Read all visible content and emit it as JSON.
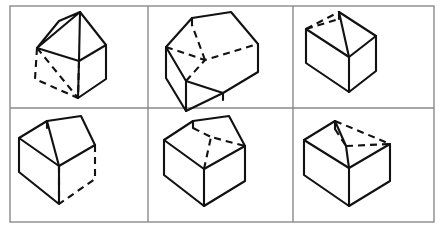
{
  "figure": {
    "width": 441,
    "height": 231,
    "columns": 3,
    "rows": 2,
    "background_color": "#ffffff",
    "line_color": "#111111",
    "frame_color": "#8a8a8a"
  },
  "grid": {
    "outer_frame": {
      "x": 10,
      "y": 6,
      "width": 424,
      "height": 216
    },
    "vertical_dividers": [
      148,
      293
    ],
    "horizontal_dividers": [
      108
    ]
  },
  "panels": [
    {
      "id": "panel-1",
      "position": "top-left",
      "row": 1,
      "column": 1,
      "label": "Box with hidden left and bottom-front edges dashed",
      "hidden_edge_count": 5,
      "solid_edges": [
        [
          38,
          47,
          58,
          22
        ],
        [
          58,
          22,
          78,
          12
        ],
        [
          78,
          12,
          38,
          47
        ],
        [
          78,
          12,
          104,
          46
        ],
        [
          104,
          46,
          78,
          60
        ],
        [
          78,
          12,
          78,
          60
        ],
        [
          38,
          47,
          78,
          60
        ],
        [
          78,
          60,
          104,
          46
        ],
        [
          104,
          46,
          104,
          78
        ],
        [
          104,
          78,
          76,
          97
        ],
        [
          78,
          60,
          76,
          97
        ]
      ],
      "dashed_edges": [
        [
          38,
          47,
          36,
          78
        ],
        [
          36,
          78,
          76,
          97
        ],
        [
          38,
          47,
          76,
          97
        ],
        [
          78,
          60,
          76,
          97
        ],
        [
          36,
          78,
          76,
          97
        ]
      ]
    },
    {
      "id": "panel-2",
      "position": "top-middle",
      "row": 1,
      "column": 2,
      "label": "Box with hidden far-top rim edges dashed",
      "hidden_edge_count": 3,
      "solid_edges": [
        [
          167,
          47,
          192,
          18
        ],
        [
          192,
          18,
          230,
          12
        ],
        [
          230,
          12,
          257,
          44
        ],
        [
          167,
          47,
          186,
          80
        ],
        [
          186,
          80,
          222,
          92
        ],
        [
          222,
          92,
          257,
          72
        ],
        [
          257,
          44,
          257,
          72
        ],
        [
          186,
          80,
          186,
          110
        ],
        [
          186,
          110,
          222,
          92
        ],
        [
          167,
          47,
          167,
          78
        ],
        [
          167,
          78,
          186,
          110
        ],
        [
          186,
          110,
          222,
          92
        ],
        [
          222,
          92,
          222,
          100
        ]
      ],
      "dashed_edges": [
        [
          167,
          47,
          205,
          60
        ],
        [
          205,
          60,
          257,
          44
        ],
        [
          205,
          60,
          192,
          18
        ],
        [
          186,
          80,
          205,
          60
        ]
      ]
    },
    {
      "id": "panel-3",
      "position": "top-right",
      "row": 1,
      "column": 3,
      "label": "Box with hidden upper-left rim edges dashed",
      "hidden_edge_count": 2,
      "solid_edges": [
        [
          306,
          28,
          338,
          12
        ],
        [
          338,
          12,
          374,
          35
        ],
        [
          374,
          35,
          348,
          56
        ],
        [
          306,
          28,
          348,
          56
        ],
        [
          338,
          12,
          348,
          56
        ],
        [
          306,
          28,
          306,
          62
        ],
        [
          306,
          62,
          348,
          90
        ],
        [
          348,
          90,
          348,
          56
        ],
        [
          348,
          90,
          374,
          70
        ],
        [
          374,
          35,
          374,
          70
        ],
        [
          348,
          90,
          348,
          100
        ],
        [
          306,
          62,
          348,
          100
        ],
        [
          348,
          100,
          374,
          70
        ]
      ],
      "dashed_edges": [
        [
          306,
          28,
          330,
          16
        ],
        [
          330,
          16,
          338,
          12
        ],
        [
          306,
          28,
          320,
          20
        ]
      ]
    },
    {
      "id": "panel-4",
      "position": "bottom-left",
      "row": 2,
      "column": 1,
      "label": "Box with hidden right-side vertical and bottom edges dashed",
      "hidden_edge_count": 4,
      "solid_edges": [
        [
          19,
          138,
          46,
          122
        ],
        [
          46,
          122,
          80,
          117
        ],
        [
          80,
          117,
          19,
          138
        ],
        [
          80,
          117,
          93,
          145
        ],
        [
          19,
          138,
          58,
          165
        ],
        [
          58,
          165,
          93,
          145
        ],
        [
          58,
          165,
          58,
          195
        ],
        [
          19,
          138,
          19,
          172
        ],
        [
          19,
          172,
          58,
          203
        ],
        [
          58,
          203,
          58,
          165
        ],
        [
          46,
          122,
          58,
          165
        ]
      ],
      "dashed_edges": [
        [
          93,
          145,
          93,
          178
        ],
        [
          93,
          178,
          58,
          203
        ],
        [
          58,
          165,
          58,
          203
        ],
        [
          58,
          203,
          93,
          178
        ]
      ]
    },
    {
      "id": "panel-5",
      "position": "bottom-middle",
      "row": 2,
      "column": 2,
      "label": "Box with hidden interior rim edges on the right dashed",
      "hidden_edge_count": 3,
      "solid_edges": [
        [
          165,
          140,
          192,
          122
        ],
        [
          192,
          122,
          228,
          117
        ],
        [
          228,
          117,
          165,
          140
        ],
        [
          228,
          117,
          243,
          145
        ],
        [
          165,
          140,
          203,
          168
        ],
        [
          203,
          168,
          243,
          145
        ],
        [
          165,
          140,
          165,
          175
        ],
        [
          165,
          175,
          203,
          205
        ],
        [
          203,
          205,
          203,
          168
        ],
        [
          203,
          205,
          243,
          180
        ],
        [
          243,
          145,
          243,
          180
        ],
        [
          192,
          122,
          203,
          168
        ]
      ],
      "dashed_edges": [
        [
          203,
          168,
          209,
          137
        ],
        [
          209,
          137,
          243,
          145
        ],
        [
          192,
          122,
          209,
          137
        ]
      ]
    },
    {
      "id": "panel-6",
      "position": "bottom-right",
      "row": 2,
      "column": 3,
      "label": "Box with hidden upper-right rim edges dashed",
      "hidden_edge_count": 3,
      "solid_edges": [
        [
          305,
          140,
          334,
          122
        ],
        [
          334,
          122,
          305,
          140
        ],
        [
          305,
          140,
          348,
          167
        ],
        [
          348,
          167,
          388,
          143
        ],
        [
          305,
          140,
          305,
          175
        ],
        [
          305,
          175,
          348,
          205
        ],
        [
          348,
          205,
          348,
          167
        ],
        [
          348,
          205,
          388,
          180
        ],
        [
          388,
          143,
          388,
          180
        ],
        [
          334,
          122,
          345,
          145
        ],
        [
          345,
          145,
          348,
          167
        ]
      ],
      "dashed_edges": [
        [
          334,
          122,
          388,
          143
        ],
        [
          345,
          145,
          388,
          143
        ],
        [
          334,
          122,
          345,
          145
        ]
      ]
    }
  ]
}
